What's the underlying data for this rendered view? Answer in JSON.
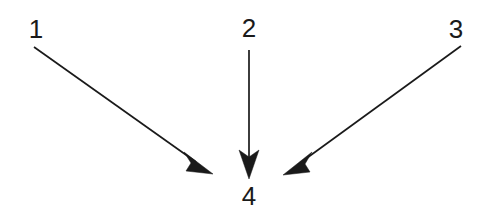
{
  "diagram": {
    "type": "callout-arrows",
    "background_color": "#ffffff",
    "ink_color": "#1a1a1a",
    "canvas": {
      "width": 490,
      "height": 211
    },
    "labels": [
      {
        "id": "label-1",
        "text": "1",
        "x": 36,
        "y": 38
      },
      {
        "id": "label-2",
        "text": "2",
        "x": 249,
        "y": 37
      },
      {
        "id": "label-3",
        "text": "3",
        "x": 456,
        "y": 38
      },
      {
        "id": "label-4",
        "text": "4",
        "x": 249,
        "y": 205
      }
    ],
    "arrows": [
      {
        "id": "arrow-from-1",
        "from_label": "1",
        "to_label": "4",
        "direction": "down-right",
        "start": {
          "x": 34,
          "y": 47
        },
        "end": {
          "x": 213,
          "y": 174
        },
        "shaft_end": {
          "x": 196,
          "y": 162
        },
        "head_points": "213,174 184,152 191,163 186,171",
        "line_width": 1.7
      },
      {
        "id": "arrow-from-2",
        "from_label": "2",
        "to_label": "4",
        "direction": "down",
        "start": {
          "x": 249,
          "y": 50
        },
        "end": {
          "x": 249,
          "y": 179
        },
        "shaft_end": {
          "x": 249,
          "y": 160
        },
        "head_points": "249,179 239,150 249,157 259,150",
        "line_width": 1.7
      },
      {
        "id": "arrow-from-3",
        "from_label": "3",
        "to_label": "4",
        "direction": "down-left",
        "start": {
          "x": 461,
          "y": 46
        },
        "end": {
          "x": 283,
          "y": 175
        },
        "shaft_end": {
          "x": 300,
          "y": 163
        },
        "head_points": "283,175 312,152 305,164 310,172",
        "line_width": 1.7
      }
    ]
  }
}
